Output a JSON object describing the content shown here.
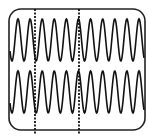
{
  "figure": {
    "screen": {
      "x": 9,
      "y": 9,
      "width": 136,
      "height": 121,
      "corner_radius": 12,
      "stroke": "#222222"
    },
    "traces": [
      {
        "name": "upper-trace",
        "center_y": 40,
        "amplitude": 21,
        "period": 12.1,
        "phase_x": 18,
        "x_start": 10,
        "x_end": 144,
        "color": "#111111"
      },
      {
        "name": "lower-trace",
        "center_y": 92,
        "amplitude": 21,
        "period": 12.1,
        "phase_x": 18,
        "x_start": 10,
        "x_end": 144,
        "color": "#111111"
      }
    ],
    "markers": [
      {
        "name": "dashed-marker-1",
        "x": 35,
        "y_start": 9,
        "y_end": 134
      },
      {
        "name": "dashed-marker-2",
        "x": 79,
        "y_start": 9,
        "y_end": 134
      }
    ]
  }
}
